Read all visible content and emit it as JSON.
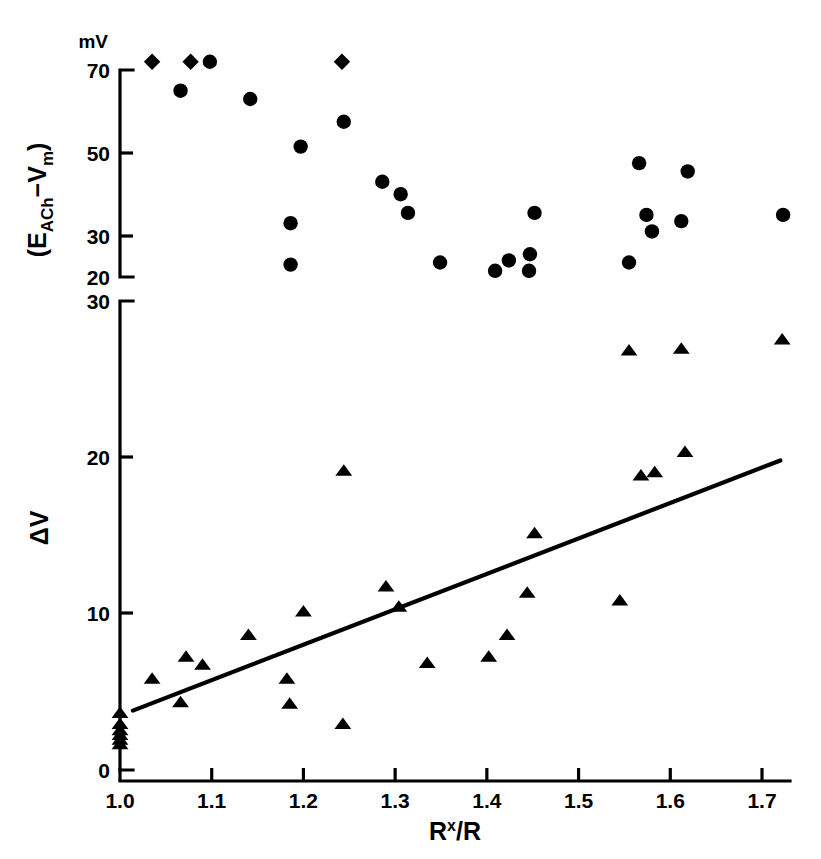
{
  "figure": {
    "background_color": "#ffffff",
    "ink_color": "#000000"
  },
  "axes": {
    "x": {
      "title_main": "R",
      "title_sup": "x",
      "title_rest": "/R",
      "ticks": [
        "1.0",
        "1.1",
        "1.2",
        "1.3",
        "1.4",
        "1.5",
        "1.6",
        "1.7"
      ],
      "min": 1.0,
      "max": 1.7
    },
    "upper_y": {
      "unit": "mV",
      "title_open": "(E",
      "title_sub1": "ACh",
      "title_minus": "−V",
      "title_sub2": "m",
      "title_close": ")",
      "ticks": [
        "70",
        "50",
        "30",
        "20"
      ],
      "tick_values": [
        70,
        50,
        30,
        20
      ],
      "min": 20,
      "max": 70
    },
    "lower_y": {
      "title": "ΔV",
      "ticks": [
        "30",
        "20",
        "10",
        "0"
      ],
      "tick_values": [
        30,
        20,
        10,
        0
      ],
      "min": 0,
      "max": 30
    }
  },
  "chart_data": [
    {
      "type": "scatter",
      "panel": "upper",
      "title": "",
      "xlabel": "Rˣ/R",
      "ylabel": "(E_ACh − V_m)",
      "unit": "mV",
      "xlim": [
        1.0,
        1.7
      ],
      "ylim": [
        20,
        70
      ],
      "grid": false,
      "legend": "none",
      "series": [
        {
          "name": "driving force (saturated, off-scale)",
          "marker": "diamond",
          "points": [
            {
              "x": 1.035,
              "y": 72.0
            },
            {
              "x": 1.077,
              "y": 72.0
            },
            {
              "x": 1.242,
              "y": 72.0
            }
          ]
        },
        {
          "name": "driving force",
          "marker": "circle",
          "points": [
            {
              "x": 1.098,
              "y": 72.0
            },
            {
              "x": 1.066,
              "y": 65.0
            },
            {
              "x": 1.142,
              "y": 63.0
            },
            {
              "x": 1.244,
              "y": 57.5
            },
            {
              "x": 1.197,
              "y": 51.5
            },
            {
              "x": 1.286,
              "y": 43.0
            },
            {
              "x": 1.306,
              "y": 40.0
            },
            {
              "x": 1.314,
              "y": 35.5
            },
            {
              "x": 1.186,
              "y": 33.0
            },
            {
              "x": 1.452,
              "y": 35.5
            },
            {
              "x": 1.566,
              "y": 47.5
            },
            {
              "x": 1.619,
              "y": 45.5
            },
            {
              "x": 1.574,
              "y": 35.0
            },
            {
              "x": 1.58,
              "y": 31.0
            },
            {
              "x": 1.612,
              "y": 33.5
            },
            {
              "x": 1.723,
              "y": 35.0
            },
            {
              "x": 1.186,
              "y": 23.0
            },
            {
              "x": 1.349,
              "y": 23.5
            },
            {
              "x": 1.409,
              "y": 21.5
            },
            {
              "x": 1.424,
              "y": 24.0
            },
            {
              "x": 1.447,
              "y": 25.5
            },
            {
              "x": 1.446,
              "y": 21.5
            },
            {
              "x": 1.555,
              "y": 23.5
            }
          ]
        }
      ]
    },
    {
      "type": "scatter",
      "panel": "lower",
      "title": "",
      "xlabel": "Rˣ/R",
      "ylabel": "ΔV",
      "xlim": [
        1.0,
        1.7
      ],
      "ylim": [
        0,
        30
      ],
      "grid": false,
      "legend": "none",
      "series": [
        {
          "name": "ΔV",
          "marker": "triangle",
          "points": [
            {
              "x": 1.0,
              "y": 2.9
            },
            {
              "x": 1.0,
              "y": 2.5
            },
            {
              "x": 1.0,
              "y": 2.2
            },
            {
              "x": 1.0,
              "y": 1.9
            },
            {
              "x": 1.0,
              "y": 1.6
            },
            {
              "x": 1.0,
              "y": 3.6
            },
            {
              "x": 1.035,
              "y": 5.8
            },
            {
              "x": 1.066,
              "y": 4.3
            },
            {
              "x": 1.072,
              "y": 7.2
            },
            {
              "x": 1.09,
              "y": 6.7
            },
            {
              "x": 1.14,
              "y": 8.6
            },
            {
              "x": 1.182,
              "y": 5.8
            },
            {
              "x": 1.185,
              "y": 4.2
            },
            {
              "x": 1.2,
              "y": 10.1
            },
            {
              "x": 1.243,
              "y": 2.9
            },
            {
              "x": 1.244,
              "y": 19.1
            },
            {
              "x": 1.29,
              "y": 11.7
            },
            {
              "x": 1.304,
              "y": 10.4
            },
            {
              "x": 1.335,
              "y": 6.8
            },
            {
              "x": 1.402,
              "y": 7.2
            },
            {
              "x": 1.422,
              "y": 8.6
            },
            {
              "x": 1.444,
              "y": 11.3
            },
            {
              "x": 1.452,
              "y": 15.1
            },
            {
              "x": 1.545,
              "y": 10.8
            },
            {
              "x": 1.555,
              "y": 26.8
            },
            {
              "x": 1.568,
              "y": 18.8
            },
            {
              "x": 1.583,
              "y": 19.0
            },
            {
              "x": 1.612,
              "y": 26.9
            },
            {
              "x": 1.616,
              "y": 20.3
            },
            {
              "x": 1.722,
              "y": 27.5
            }
          ]
        }
      ],
      "fit_line": {
        "name": "linear regression",
        "x_start": 1.014,
        "y_start": 3.8,
        "x_end": 1.72,
        "y_end": 19.8
      }
    }
  ]
}
